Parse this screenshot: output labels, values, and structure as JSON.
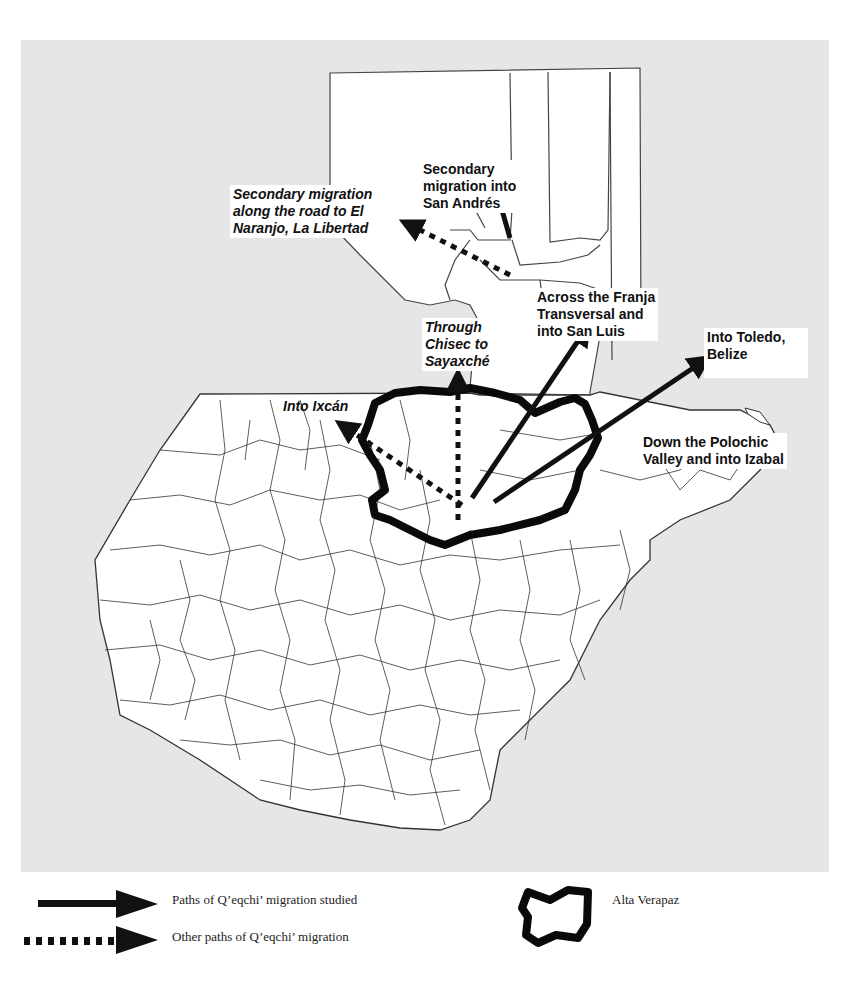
{
  "figure": {
    "colors": {
      "background": "#e6e6e6",
      "land": "#ffffff",
      "borders": "#333333",
      "arrows": "#111111",
      "region_outline": "#0a0a0a"
    }
  },
  "map": {
    "labels": [
      {
        "id": "san-andres",
        "text": "Secondary\nmigration into\nSan Andrés",
        "style": "bold"
      },
      {
        "id": "el-naranjo",
        "text": "Secondary migration\nalong the road to El\nNaranjo, La Libertad",
        "style": "bold-italic"
      },
      {
        "id": "franja",
        "text": "Across the Franja\nTransversal and\ninto San Luis",
        "style": "bold"
      },
      {
        "id": "chisec",
        "text": "Through\nChisec to\nSayaxché",
        "style": "bold-italic"
      },
      {
        "id": "toledo",
        "text": "Into Toledo,\nBelize",
        "style": "bold"
      },
      {
        "id": "ixcan",
        "text": "Into Ixcán",
        "style": "bold-italic"
      },
      {
        "id": "polochic",
        "text": "Down the Polochic\nValley and into Izabal",
        "style": "bold"
      }
    ],
    "region_outlined": "Alta Verapaz"
  },
  "legend": {
    "solid_arrow": "Paths of Q’eqchi’ migration studied",
    "dotted_arrow": "Other paths of Q’eqchi’ migration",
    "outline": "Alta Verapaz"
  }
}
